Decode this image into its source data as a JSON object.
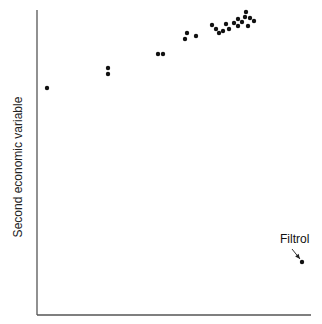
{
  "chart_data": {
    "type": "scatter",
    "title": "",
    "xlabel": "",
    "ylabel": "Second economic variable",
    "grid": false,
    "legend": null,
    "axes_pixel": {
      "x0": 37,
      "y0": 315,
      "x1": 311,
      "y1": 10
    },
    "points": [
      {
        "x": 47,
        "y": 88
      },
      {
        "x": 108,
        "y": 68
      },
      {
        "x": 108,
        "y": 74
      },
      {
        "x": 158,
        "y": 54
      },
      {
        "x": 163,
        "y": 54
      },
      {
        "x": 185,
        "y": 39
      },
      {
        "x": 187,
        "y": 33
      },
      {
        "x": 196,
        "y": 36
      },
      {
        "x": 212,
        "y": 25
      },
      {
        "x": 216,
        "y": 29
      },
      {
        "x": 219,
        "y": 33
      },
      {
        "x": 223,
        "y": 31
      },
      {
        "x": 226,
        "y": 24
      },
      {
        "x": 229,
        "y": 29
      },
      {
        "x": 234,
        "y": 23
      },
      {
        "x": 238,
        "y": 19
      },
      {
        "x": 238,
        "y": 26
      },
      {
        "x": 242,
        "y": 22
      },
      {
        "x": 245,
        "y": 17
      },
      {
        "x": 246,
        "y": 12
      },
      {
        "x": 248,
        "y": 26
      },
      {
        "x": 250,
        "y": 18
      },
      {
        "x": 254,
        "y": 21
      },
      {
        "x": 302,
        "y": 262,
        "label": "Filtrol"
      }
    ],
    "annotations": [
      {
        "text": "Filtrol",
        "text_x": 280,
        "text_y": 244,
        "arrow_from": [
          292,
          249
        ],
        "arrow_to": [
          300,
          259
        ]
      }
    ],
    "note": "Point coordinates are in screen pixel space; axes have no ticks or numeric labels."
  },
  "labels": {
    "y_axis": "Second economic variable",
    "annotation": "Filtrol"
  },
  "colors": {
    "axis": "#555555",
    "point": "#111111",
    "text": "#222222"
  }
}
